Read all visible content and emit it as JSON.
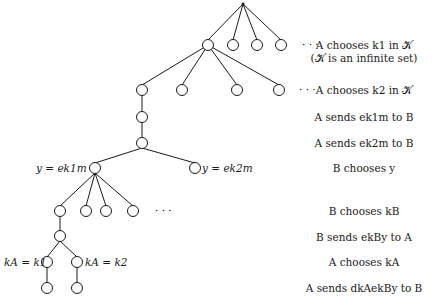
{
  "diagram": {
    "type": "protocol game tree",
    "node_labels": {
      "y_left": "y = ek1m",
      "y_right": "y = ek2m",
      "ka_left": "kA = k1",
      "ka_right": "kA = k2"
    },
    "ellipsis": "· · ·",
    "steps": [
      {
        "text": "A chooses k1 in 𝒦"
      },
      {
        "text": "(𝒦 is an infinite set)"
      },
      {
        "text": "A chooses k2 in 𝒦"
      },
      {
        "text": "A sends ek1m to B"
      },
      {
        "text": "A sends ek2m to B"
      },
      {
        "text": "B chooses y"
      },
      {
        "text": "B chooses kB"
      },
      {
        "text": "B sends ekBy to A"
      },
      {
        "text": "A chooses kA"
      },
      {
        "text": "A sends dkAekBy to B"
      }
    ],
    "colors": {
      "ink": "#1a1a1a",
      "background": "#ffffff"
    }
  }
}
